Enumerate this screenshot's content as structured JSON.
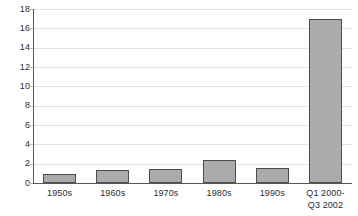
{
  "chart_data": {
    "type": "bar",
    "title": "",
    "subtitle": "",
    "xlabel": "",
    "ylabel": "",
    "categories": [
      "1950s",
      "1960s",
      "1970s",
      "1980s",
      "1990s",
      "Q1 2000-\nQ3 2002"
    ],
    "category_lines": [
      [
        "1950s"
      ],
      [
        "1960s"
      ],
      [
        "1970s"
      ],
      [
        "1980s"
      ],
      [
        "1990s"
      ],
      [
        "Q1 2000-",
        "Q3 2002"
      ]
    ],
    "values": [
      0.9,
      1.3,
      1.4,
      2.4,
      1.6,
      17
    ],
    "ylim": [
      0,
      18
    ],
    "ytick_values": [
      0,
      2,
      4,
      6,
      8,
      10,
      12,
      14,
      16,
      18
    ],
    "ytick_labels": [
      "0",
      "2",
      "4",
      "6",
      "8",
      "10",
      "12",
      "14",
      "16",
      "18"
    ],
    "grid": true,
    "legend": false,
    "legend_position": "none",
    "bar_fill_color": "#ababab",
    "bar_border_color": "#4c4c4c",
    "gridline_color": "#e2e2e2",
    "axis_color": "#555759",
    "background_color": "#ffffff",
    "text_color": "#2b2b2b"
  }
}
